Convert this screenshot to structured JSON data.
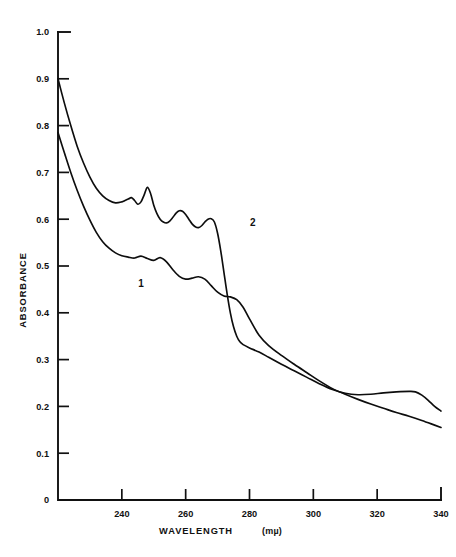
{
  "header": {
    "running_head": ""
  },
  "chart_data": {
    "type": "line",
    "title": "",
    "xlabel": "WAVELENGTH",
    "xunit": "(mµ)",
    "ylabel": "ABSORBANCE",
    "xlim": [
      220,
      340
    ],
    "ylim": [
      0,
      1.0
    ],
    "grid": false,
    "legend_position": "inline-labels",
    "x_ticks": [
      240,
      260,
      280,
      300,
      320,
      340
    ],
    "x_tick_labels": [
      "240",
      "260",
      "280",
      "300",
      "320",
      "340"
    ],
    "y_ticks": [
      0,
      0.1,
      0.2,
      0.3,
      0.4,
      0.5,
      0.6,
      0.7,
      0.8,
      0.9,
      1.0
    ],
    "y_tick_labels": [
      "0",
      "0.1",
      "0.2",
      "0.3",
      "0.4",
      "0.5",
      "0.6",
      "0.7",
      "0.8",
      "0.9",
      "1.0"
    ],
    "annotations": [
      {
        "text": "1",
        "x": 246,
        "y": 0.455
      },
      {
        "text": "2",
        "x": 281,
        "y": 0.585
      }
    ],
    "series": [
      {
        "name": "1",
        "label": "1",
        "x": [
          220,
          222,
          224,
          226,
          228,
          230,
          232,
          234,
          236,
          238,
          240,
          242,
          244,
          246,
          248,
          250,
          252,
          254,
          256,
          258,
          260,
          262,
          264,
          266,
          268,
          270,
          272,
          274,
          276,
          278,
          280,
          283,
          286,
          290,
          294,
          298,
          302,
          306,
          310,
          314,
          318,
          322,
          326,
          330,
          334,
          338,
          340
        ],
        "y": [
          0.785,
          0.742,
          0.7,
          0.662,
          0.628,
          0.598,
          0.572,
          0.552,
          0.538,
          0.528,
          0.522,
          0.519,
          0.517,
          0.521,
          0.516,
          0.512,
          0.518,
          0.509,
          0.492,
          0.478,
          0.472,
          0.474,
          0.477,
          0.472,
          0.458,
          0.444,
          0.436,
          0.434,
          0.428,
          0.412,
          0.387,
          0.352,
          0.33,
          0.309,
          0.29,
          0.272,
          0.254,
          0.238,
          0.226,
          0.215,
          0.205,
          0.196,
          0.187,
          0.179,
          0.17,
          0.16,
          0.155
        ]
      },
      {
        "name": "2",
        "label": "2",
        "x": [
          220,
          222,
          224,
          226,
          228,
          230,
          232,
          234,
          236,
          238,
          240,
          241,
          242,
          243,
          244,
          245,
          246,
          247,
          248,
          249,
          250,
          251,
          252,
          253,
          254,
          255,
          256,
          257,
          258,
          259,
          260,
          261,
          262,
          263,
          264,
          265,
          266,
          267,
          268,
          269,
          270,
          271,
          272,
          273,
          274,
          275,
          276,
          277,
          278,
          280,
          283,
          286,
          290,
          294,
          298,
          302,
          306,
          310,
          314,
          318,
          322,
          326,
          330,
          332,
          334,
          336,
          338,
          340
        ],
        "y": [
          0.9,
          0.848,
          0.8,
          0.756,
          0.72,
          0.69,
          0.666,
          0.65,
          0.64,
          0.635,
          0.637,
          0.64,
          0.643,
          0.646,
          0.64,
          0.632,
          0.637,
          0.652,
          0.668,
          0.655,
          0.63,
          0.612,
          0.6,
          0.594,
          0.592,
          0.596,
          0.604,
          0.613,
          0.618,
          0.617,
          0.61,
          0.6,
          0.59,
          0.584,
          0.582,
          0.586,
          0.594,
          0.6,
          0.601,
          0.594,
          0.57,
          0.532,
          0.486,
          0.44,
          0.4,
          0.37,
          0.35,
          0.338,
          0.332,
          0.325,
          0.316,
          0.305,
          0.29,
          0.276,
          0.262,
          0.248,
          0.236,
          0.228,
          0.225,
          0.226,
          0.229,
          0.231,
          0.232,
          0.231,
          0.224,
          0.213,
          0.2,
          0.19
        ]
      }
    ]
  }
}
